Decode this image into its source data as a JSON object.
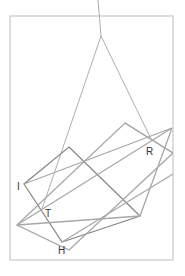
{
  "diagram": {
    "type": "geometry-construction",
    "frame": {
      "x": 10,
      "y": 16,
      "width": 163,
      "height": 244,
      "stroke": "#c8c8c8"
    },
    "colors": {
      "dark_line": "#888888",
      "light_line": "#a8a8a8",
      "thin_line": "#999999",
      "label": "#333333"
    },
    "points": {
      "top_out": [
        98,
        0
      ],
      "apex": [
        101,
        36
      ],
      "R": [
        152,
        141
      ],
      "I": [
        24,
        184
      ],
      "T": [
        42,
        209
      ],
      "H": [
        62,
        242
      ],
      "A": [
        69,
        147
      ],
      "B": [
        140,
        216
      ],
      "C": [
        125,
        123
      ],
      "D": [
        17,
        225
      ],
      "E": [
        172,
        128
      ]
    },
    "labels": [
      {
        "id": "label-R",
        "text": "R",
        "x": 146,
        "y": 155
      },
      {
        "id": "label-I",
        "text": "I",
        "x": 17,
        "y": 190
      },
      {
        "id": "label-T",
        "text": "T",
        "x": 45,
        "y": 217
      },
      {
        "id": "label-H",
        "text": "H",
        "x": 58,
        "y": 254
      }
    ]
  }
}
